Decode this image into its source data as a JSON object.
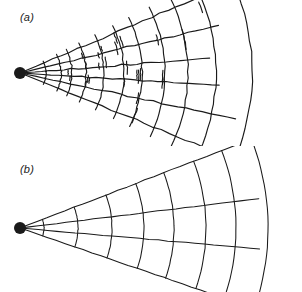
{
  "figure": {
    "background_color": "#ffffff",
    "ink_color": "#1a1a1a",
    "width": 302,
    "height": 292
  },
  "panels": [
    {
      "id": "a",
      "label": "(a)",
      "style": "irregular",
      "apex": {
        "x": 20,
        "y": 73,
        "dot_radius": 6
      },
      "radial_count": 6,
      "arc_count": 11,
      "half_angle_deg": 23,
      "note": "Arcs are unevenly spaced and overshoot the bounding radials; radial lines are drawn with a jagged hand-drawn quality."
    },
    {
      "id": "b",
      "label": "(b)",
      "style": "regular",
      "apex": {
        "x": 20,
        "y": 82,
        "dot_radius": 6
      },
      "radial_count": 4,
      "arc_count": 8,
      "half_angle_deg": 21,
      "note": "Arcs are smooth, evenly spaced and terminate cleanly on the bounding radials."
    }
  ],
  "geometry": {
    "panel_a": {
      "radial_angles_deg": [
        -23,
        -13.5,
        -4.5,
        3.5,
        12,
        22
      ],
      "arc_radii": [
        26,
        41,
        52,
        66,
        84,
        104,
        122,
        145,
        168,
        196,
        232
      ],
      "arc_overshoot_deg": 4
    },
    "panel_b": {
      "radial_angles_deg": [
        -21,
        -7,
        5,
        19
      ],
      "arc_radii": [
        24,
        58,
        92,
        124,
        154,
        186,
        216,
        248
      ],
      "arc_overshoot_deg": 0
    }
  },
  "chart_data": {
    "type": "line",
    "title": "",
    "xlabel": "",
    "ylabel": "",
    "legend": [],
    "series": [
      {
        "name": "panel-a-radials",
        "values": [
          -23,
          -13.5,
          -4.5,
          3.5,
          12,
          22
        ]
      },
      {
        "name": "panel-a-arc-radii",
        "values": [
          26,
          41,
          52,
          66,
          84,
          104,
          122,
          145,
          168,
          196,
          232
        ]
      },
      {
        "name": "panel-b-radials",
        "values": [
          -21,
          -7,
          5,
          19
        ]
      },
      {
        "name": "panel-b-arc-radii",
        "values": [
          24,
          58,
          92,
          124,
          154,
          186,
          216,
          248
        ]
      }
    ]
  }
}
